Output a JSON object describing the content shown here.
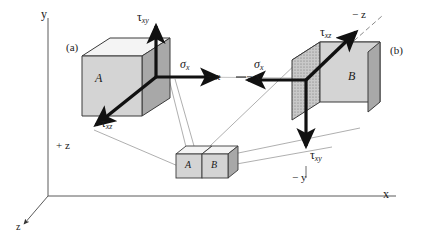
{
  "figure": {
    "kind": "stress-element-axes-diagram",
    "panels": [
      {
        "id": "a",
        "label": "(a)"
      },
      {
        "id": "b",
        "label": "(b)"
      }
    ],
    "axes": {
      "y_pos": "y",
      "x_pos": "x",
      "z_pos": "z",
      "plus_x": "+ x",
      "minus_x": "− x",
      "plus_z": "+ z",
      "minus_z": "− z",
      "minus_y": "− y"
    },
    "stress_labels": {
      "sigma_left": {
        "sym": "σ",
        "sub": "x"
      },
      "sigma_right": {
        "sym": "σ",
        "sub": "x"
      },
      "tau_xy_left": {
        "sym": "τ",
        "sub": "xy"
      },
      "tau_xz_left": {
        "sym": "τ",
        "sub": "xz"
      },
      "tau_xz_right": {
        "sym": "τ",
        "sub": "xz"
      },
      "tau_xy_right": {
        "sym": "τ",
        "sub": "xy"
      }
    },
    "cubes": {
      "left_face_label": "A",
      "right_face_label": "B",
      "small_left_label": "A",
      "small_right_label": "B"
    },
    "colors": {
      "front_face": "#d4d4d4",
      "side_face": "#a8a8a8",
      "top_face": "#f2f2f2",
      "hatched_face": "#c9c9c9",
      "outline": "#3a3a3a",
      "arrow": "#111111",
      "thin_line": "#9a9a9a",
      "axis": "#555555",
      "text": "#1a1a1a",
      "background": "#ffffff"
    }
  }
}
